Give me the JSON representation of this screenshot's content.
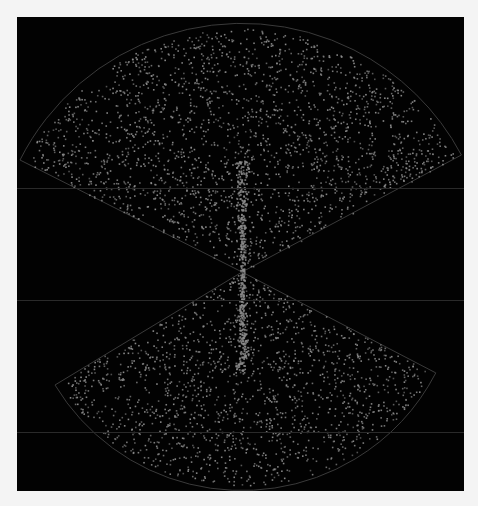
{
  "figure": {
    "kind": "galaxy-redshift-survey-cone-diagram",
    "background": "#020202",
    "page_background": "#f4f4f4",
    "dot_color": "#8c8c8c",
    "outline_color": "#3a3a3a",
    "panel": {
      "x": 17,
      "y": 17,
      "width": 447,
      "height": 474
    }
  },
  "wedges": [
    {
      "name": "north-wedge",
      "apex": [
        242,
        272
      ],
      "left_tip": [
        20,
        160
      ],
      "right_tip": [
        452,
        160
      ],
      "arc_top": [
        240,
        21
      ],
      "dot_count": 2600
    },
    {
      "name": "south-wedge",
      "apex": [
        242,
        272
      ],
      "left_tip": [
        55,
        385
      ],
      "right_tip": [
        436,
        373
      ],
      "arc_bottom": [
        240,
        486
      ],
      "dot_count": 1900
    }
  ],
  "guide_lines_y": [
    188,
    300,
    432
  ]
}
